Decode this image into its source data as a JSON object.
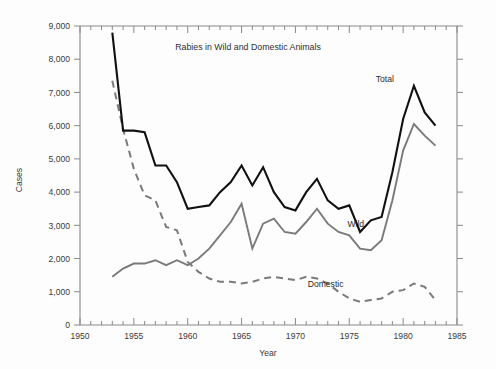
{
  "chart_data": {
    "type": "line",
    "title": "Rabies in Wild and Domestic Animals",
    "xlabel": "Year",
    "ylabel": "Cases",
    "xlim": [
      1950,
      1985
    ],
    "ylim": [
      0,
      9000
    ],
    "xticks": [
      1950,
      1955,
      1960,
      1965,
      1970,
      1975,
      1980,
      1985
    ],
    "xtick_labels": [
      "1950",
      "1955",
      "1960",
      "1965",
      "1970",
      "1975",
      "1980",
      "1985"
    ],
    "xtick_minor_step": 1,
    "yticks": [
      0,
      1000,
      2000,
      3000,
      4000,
      5000,
      6000,
      7000,
      8000,
      9000
    ],
    "ytick_labels": [
      "0",
      "1,000",
      "2,000",
      "3,000",
      "4,000",
      "5,000",
      "6,000",
      "7,000",
      "8,000",
      "9,000"
    ],
    "grid": false,
    "legend": "inline-annotations",
    "x": [
      1953,
      1954,
      1955,
      1956,
      1957,
      1958,
      1959,
      1960,
      1961,
      1962,
      1963,
      1964,
      1965,
      1966,
      1967,
      1968,
      1969,
      1970,
      1971,
      1972,
      1973,
      1974,
      1975,
      1976,
      1977,
      1978,
      1979,
      1980,
      1981,
      1982,
      1983
    ],
    "series": [
      {
        "name": "Total",
        "style": "solid",
        "color": "#111111",
        "label_text": "Total",
        "values": [
          8800,
          5850,
          5850,
          5800,
          4800,
          4800,
          4300,
          3500,
          3550,
          3600,
          4000,
          4300,
          4800,
          4200,
          4750,
          4000,
          3550,
          3450,
          4000,
          4400,
          3750,
          3500,
          3600,
          2800,
          3150,
          3250,
          4600,
          6200,
          7200,
          6400,
          6000
        ]
      },
      {
        "name": "Wild",
        "style": "solid",
        "color": "#7a7a7a",
        "label_text": "Wild",
        "values": [
          1450,
          1700,
          1850,
          1850,
          1950,
          1800,
          1950,
          1800,
          2000,
          2300,
          2700,
          3100,
          3650,
          2300,
          3050,
          3200,
          2800,
          2750,
          3100,
          3500,
          3050,
          2800,
          2700,
          2300,
          2250,
          2550,
          3750,
          5250,
          6050,
          5700,
          5400
        ]
      },
      {
        "name": "Domestic",
        "style": "dashed",
        "color": "#7a7a7a",
        "label_text": "Domestic",
        "values": [
          7350,
          5900,
          4700,
          3900,
          3750,
          2950,
          2850,
          1900,
          1600,
          1400,
          1300,
          1300,
          1250,
          1300,
          1400,
          1450,
          1400,
          1350,
          1450,
          1400,
          1250,
          1000,
          800,
          700,
          750,
          800,
          1000,
          1050,
          1250,
          1150,
          750
        ]
      }
    ],
    "annotations": [
      {
        "text": "Total",
        "x": 1978.3,
        "y": 7300
      },
      {
        "text": "Wild",
        "x": 1975.6,
        "y": 2950
      },
      {
        "text": "Domestic",
        "x": 1972.8,
        "y": 1150
      }
    ]
  }
}
